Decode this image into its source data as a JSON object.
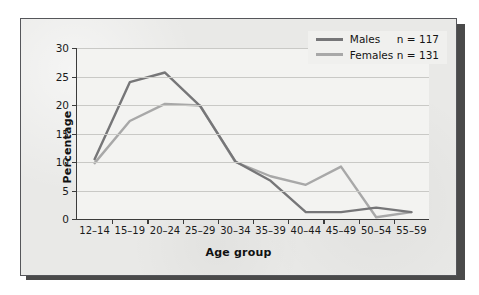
{
  "figure": {
    "panel_background": "#e9e9e7",
    "plot_background": "#f3f3f1",
    "border_color": "#55565a",
    "shadow_color": "#4a4a4a"
  },
  "chart_data": {
    "type": "line",
    "title": "",
    "subtitle": "",
    "xlabel": "Age group",
    "ylabel": "Percentage",
    "categories": [
      "12–14",
      "15–19",
      "20–24",
      "25–29",
      "30–34",
      "35–39",
      "40–44",
      "45–49",
      "50–54",
      "55–59"
    ],
    "ylim": [
      0,
      30
    ],
    "yticks": [
      0,
      5,
      10,
      15,
      20,
      25,
      30
    ],
    "ytick_labels": [
      "0",
      "5",
      "10",
      "15",
      "20",
      "25",
      "30"
    ],
    "grid": "horizontal",
    "legend_position": "top-right",
    "series": [
      {
        "name": "Males",
        "n_label": "n = 117",
        "color": "#767678",
        "values": [
          10.5,
          24.0,
          25.7,
          19.8,
          10.1,
          6.7,
          1.2,
          1.2,
          2.0,
          1.2
        ]
      },
      {
        "name": "Females",
        "n_label": "n = 131",
        "color": "#a8a8a8",
        "values": [
          9.8,
          17.2,
          20.2,
          19.9,
          10.0,
          7.5,
          6.0,
          9.2,
          0.3,
          1.2
        ]
      }
    ]
  },
  "legend": {
    "entries": [
      {
        "label": "Males",
        "n": "n = 117"
      },
      {
        "label": "Females",
        "n": "n = 131"
      }
    ]
  }
}
